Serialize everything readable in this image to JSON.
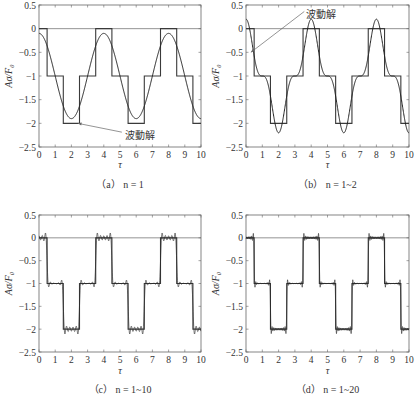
{
  "chart_data": [
    {
      "type": "line",
      "panel": "a",
      "caption": "（a）  n = 1",
      "xlabel": "τ",
      "ylabel": "Aσ/F₀",
      "xlim": [
        0,
        10
      ],
      "ylim": [
        -2.5,
        0.5
      ],
      "xticks": [
        "0",
        "1",
        "2",
        "3",
        "4",
        "5",
        "6",
        "7",
        "8",
        "9",
        "10"
      ],
      "yticks": [
        "0.5",
        "0",
        "−0.5",
        "−1",
        "−1.5",
        "−2",
        "−2.5"
      ],
      "harmonics": 1,
      "series": [
        {
          "name": "step",
          "x": [
            0,
            0.5,
            0.5,
            1.5,
            1.5,
            2.5,
            2.5,
            3.5,
            3.5,
            4.5,
            4.5,
            5.5,
            5.5,
            6.5,
            6.5,
            7.5,
            7.5,
            8.5,
            8.5,
            9.5,
            9.5,
            10
          ],
          "values": [
            0,
            0,
            -1,
            -1,
            -2,
            -2,
            -1,
            -1,
            0,
            0,
            -1,
            -1,
            -2,
            -2,
            -1,
            -1,
            0,
            0,
            -1,
            -1,
            -2,
            -2
          ]
        },
        {
          "name": "波動解 (Fourier, 1 term)",
          "min": -1.8,
          "max": 0
        }
      ],
      "annotation": {
        "text": "波動解",
        "arrow_to": [
          2.4,
          -2.0
        ]
      }
    },
    {
      "type": "line",
      "panel": "b",
      "caption": "（b）  n = 1~2",
      "xlabel": "τ",
      "ylabel": "Aσ/F₀",
      "xlim": [
        0,
        10
      ],
      "ylim": [
        -2.5,
        0.5
      ],
      "xticks": [
        "0",
        "1",
        "2",
        "3",
        "4",
        "5",
        "6",
        "7",
        "8",
        "9",
        "10"
      ],
      "yticks": [
        "0.5",
        "0",
        "−0.5",
        "−1",
        "−1.5",
        "−2",
        "−2.5"
      ],
      "harmonics": 2,
      "series": [
        {
          "name": "step",
          "x": [
            0,
            0.5,
            0.5,
            1.5,
            1.5,
            2.5,
            2.5,
            3.5,
            3.5,
            4.5,
            4.5,
            5.5,
            5.5,
            6.5,
            6.5,
            7.5,
            7.5,
            8.5,
            8.5,
            9.5,
            9.5,
            10
          ],
          "values": [
            0,
            0,
            -1,
            -1,
            -2,
            -2,
            -1,
            -1,
            0,
            0,
            -1,
            -1,
            -2,
            -2,
            -1,
            -1,
            0,
            0,
            -1,
            -1,
            -2,
            -2
          ]
        },
        {
          "name": "波動解 (Fourier, 2 terms)",
          "min": -2.4,
          "max": 0
        }
      ],
      "annotation": {
        "text": "波動解",
        "arrow_to": [
          0.3,
          -0.5
        ]
      }
    },
    {
      "type": "line",
      "panel": "c",
      "caption": "（c）  n = 1~10",
      "xlabel": "τ",
      "ylabel": "Aσ/F₀",
      "xlim": [
        0,
        10
      ],
      "ylim": [
        -2.5,
        0.5
      ],
      "xticks": [
        "0",
        "1",
        "2",
        "3",
        "4",
        "5",
        "6",
        "7",
        "8",
        "9",
        "10"
      ],
      "yticks": [
        "0.5",
        "0",
        "−0.5",
        "−1",
        "−1.5",
        "−2",
        "−2.5"
      ],
      "harmonics": 10,
      "series": [
        {
          "name": "step",
          "x": [
            0,
            0.5,
            0.5,
            1.5,
            1.5,
            2.5,
            2.5,
            3.5,
            3.5,
            4.5,
            4.5,
            5.5,
            5.5,
            6.5,
            6.5,
            7.5,
            7.5,
            8.5,
            8.5,
            9.5,
            9.5,
            10
          ],
          "values": [
            0,
            0,
            -1,
            -1,
            -2,
            -2,
            -1,
            -1,
            0,
            0,
            -1,
            -1,
            -2,
            -2,
            -1,
            -1,
            0,
            0,
            -1,
            -1,
            -2,
            -2
          ]
        },
        {
          "name": "Fourier, 10 terms"
        }
      ]
    },
    {
      "type": "line",
      "panel": "d",
      "caption": "（d）  n = 1~20",
      "xlabel": "τ",
      "ylabel": "Aσ/F₀",
      "xlim": [
        0,
        10
      ],
      "ylim": [
        -2.5,
        0.5
      ],
      "xticks": [
        "0",
        "1",
        "2",
        "3",
        "4",
        "5",
        "6",
        "7",
        "8",
        "9",
        "10"
      ],
      "yticks": [
        "0.5",
        "0",
        "−0.5",
        "−1",
        "−1.5",
        "−2",
        "−2.5"
      ],
      "harmonics": 20,
      "series": [
        {
          "name": "step",
          "x": [
            0,
            0.5,
            0.5,
            1.5,
            1.5,
            2.5,
            2.5,
            3.5,
            3.5,
            4.5,
            4.5,
            5.5,
            5.5,
            6.5,
            6.5,
            7.5,
            7.5,
            8.5,
            8.5,
            9.5,
            9.5,
            10
          ],
          "values": [
            0,
            0,
            -1,
            -1,
            -2,
            -2,
            -1,
            -1,
            0,
            0,
            -1,
            -1,
            -2,
            -2,
            -1,
            -1,
            0,
            0,
            -1,
            -1,
            -2,
            -2
          ]
        },
        {
          "name": "Fourier, 20 terms"
        }
      ]
    }
  ],
  "layout": {
    "panels": [
      {
        "x0": 39,
        "x1": 201,
        "ytop": 5,
        "ybot": 147,
        "caption_y": 188,
        "xlabel_y": 168
      },
      {
        "x0": 246,
        "x1": 409,
        "ytop": 5,
        "ybot": 147,
        "caption_y": 188,
        "xlabel_y": 168
      },
      {
        "x0": 39,
        "x1": 201,
        "ytop": 215,
        "ybot": 352,
        "caption_y": 393,
        "xlabel_y": 374
      },
      {
        "x0": 246,
        "x1": 409,
        "ytop": 215,
        "ybot": 352,
        "caption_y": 393,
        "xlabel_y": 374
      }
    ],
    "colors": {
      "axis": "#666666",
      "step": "#3a3a3a",
      "curve": "#222222",
      "text": "#333333"
    }
  }
}
